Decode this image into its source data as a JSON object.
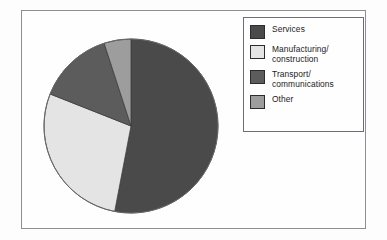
{
  "figure": {
    "background_color": "#fefefe",
    "frame_color": "#8e8e96"
  },
  "legend": {
    "title": "",
    "position": "right",
    "border_color": "#6d6d73",
    "items": [
      {
        "label": "Services",
        "color": "#4a4a4a"
      },
      {
        "label": "Manufacturing/\nconstruction",
        "color": "#e4e4e4"
      },
      {
        "label": "Transport/\ncommunications",
        "color": "#5c5c5c"
      },
      {
        "label": "Other",
        "color": "#9d9d9d"
      }
    ]
  },
  "chart_data": {
    "type": "pie",
    "title": "",
    "xlabel": "",
    "ylabel": "",
    "start_angle_deg": 0,
    "direction": "clockwise",
    "labels": [
      "Services",
      "Manufacturing/construction",
      "Transport/communications",
      "Other"
    ],
    "values": [
      53,
      28,
      14,
      5
    ],
    "units": "percent",
    "colors": [
      "#4a4a4a",
      "#e4e4e4",
      "#5c5c5c",
      "#9d9d9d"
    ],
    "slice_start_angles_deg": [
      0,
      190.8,
      291.6,
      342.0
    ],
    "slice_end_angles_deg": [
      190.8,
      291.6,
      342.0,
      360.0
    ],
    "grid": false,
    "legend_position": "right",
    "data_labels_shown": false
  }
}
